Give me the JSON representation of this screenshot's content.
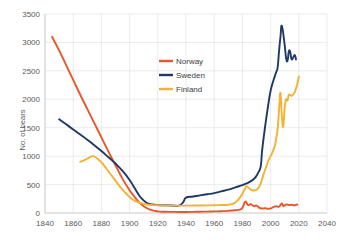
{
  "chart_data": {
    "type": "line",
    "title": "",
    "xlabel": "",
    "ylabel": "No. of bears",
    "xlim": [
      1840,
      2040
    ],
    "ylim": [
      0,
      3500
    ],
    "xticks": [
      1840,
      1860,
      1880,
      1900,
      1920,
      1940,
      1960,
      1980,
      2000,
      2020,
      2040
    ],
    "yticks": [
      0,
      500,
      1000,
      1500,
      2000,
      2500,
      3000,
      3500
    ],
    "xtick_labels": [
      "1840",
      "1860",
      "1880",
      "1900",
      "1920",
      "1940",
      "1960",
      "1980",
      "2000",
      "2020",
      "2040"
    ],
    "ytick_labels": [
      "0",
      "500",
      "1000",
      "1500",
      "2000",
      "2500",
      "3000",
      "3500"
    ],
    "grid": true,
    "legend_position": "center-upper",
    "series": [
      {
        "name": "Norway",
        "color": "#E8562A",
        "points": [
          [
            1845,
            3100
          ],
          [
            1850,
            2860
          ],
          [
            1855,
            2600
          ],
          [
            1860,
            2340
          ],
          [
            1865,
            2080
          ],
          [
            1870,
            1830
          ],
          [
            1875,
            1580
          ],
          [
            1880,
            1330
          ],
          [
            1885,
            1080
          ],
          [
            1890,
            840
          ],
          [
            1895,
            600
          ],
          [
            1900,
            400
          ],
          [
            1903,
            300
          ],
          [
            1906,
            210
          ],
          [
            1910,
            120
          ],
          [
            1915,
            55
          ],
          [
            1920,
            28
          ],
          [
            1925,
            22
          ],
          [
            1930,
            20
          ],
          [
            1935,
            18
          ],
          [
            1940,
            18
          ],
          [
            1945,
            20
          ],
          [
            1950,
            22
          ],
          [
            1955,
            25
          ],
          [
            1960,
            28
          ],
          [
            1965,
            32
          ],
          [
            1970,
            38
          ],
          [
            1975,
            48
          ],
          [
            1978,
            60
          ],
          [
            1980,
            90
          ],
          [
            1982,
            200
          ],
          [
            1984,
            140
          ],
          [
            1986,
            155
          ],
          [
            1988,
            120
          ],
          [
            1990,
            130
          ],
          [
            1992,
            90
          ],
          [
            1994,
            80
          ],
          [
            1996,
            85
          ],
          [
            1998,
            75
          ],
          [
            2000,
            80
          ],
          [
            2002,
            105
          ],
          [
            2004,
            120
          ],
          [
            2006,
            110
          ],
          [
            2008,
            170
          ],
          [
            2009,
            120
          ],
          [
            2011,
            150
          ],
          [
            2013,
            140
          ],
          [
            2015,
            145
          ],
          [
            2017,
            135
          ],
          [
            2019,
            150
          ]
        ]
      },
      {
        "name": "Sweden",
        "color": "#1F3864",
        "points": [
          [
            1850,
            1650
          ],
          [
            1855,
            1560
          ],
          [
            1860,
            1470
          ],
          [
            1865,
            1380
          ],
          [
            1870,
            1290
          ],
          [
            1875,
            1190
          ],
          [
            1880,
            1090
          ],
          [
            1885,
            980
          ],
          [
            1890,
            870
          ],
          [
            1895,
            740
          ],
          [
            1900,
            580
          ],
          [
            1905,
            380
          ],
          [
            1908,
            270
          ],
          [
            1912,
            180
          ],
          [
            1916,
            150
          ],
          [
            1920,
            140
          ],
          [
            1925,
            135
          ],
          [
            1930,
            132
          ],
          [
            1935,
            130
          ],
          [
            1938,
            190
          ],
          [
            1940,
            270
          ],
          [
            1945,
            290
          ],
          [
            1950,
            310
          ],
          [
            1955,
            330
          ],
          [
            1960,
            350
          ],
          [
            1965,
            380
          ],
          [
            1970,
            410
          ],
          [
            1975,
            450
          ],
          [
            1980,
            490
          ],
          [
            1983,
            520
          ],
          [
            1986,
            560
          ],
          [
            1989,
            620
          ],
          [
            1991,
            700
          ],
          [
            1993,
            820
          ],
          [
            1994,
            1100
          ],
          [
            1996,
            1500
          ],
          [
            1998,
            1850
          ],
          [
            2000,
            2150
          ],
          [
            2002,
            2330
          ],
          [
            2004,
            2480
          ],
          [
            2005,
            2560
          ],
          [
            2006,
            2850
          ],
          [
            2007,
            3100
          ],
          [
            2008,
            3290
          ],
          [
            2010,
            2950
          ],
          [
            2011,
            2720
          ],
          [
            2012,
            2680
          ],
          [
            2013,
            2850
          ],
          [
            2014,
            2820
          ],
          [
            2015,
            2700
          ],
          [
            2017,
            2780
          ],
          [
            2018,
            2700
          ]
        ]
      },
      {
        "name": "Finland",
        "color": "#F2B234",
        "points": [
          [
            1865,
            900
          ],
          [
            1868,
            930
          ],
          [
            1871,
            970
          ],
          [
            1874,
            1000
          ],
          [
            1877,
            960
          ],
          [
            1880,
            890
          ],
          [
            1883,
            800
          ],
          [
            1886,
            700
          ],
          [
            1889,
            600
          ],
          [
            1892,
            500
          ],
          [
            1895,
            410
          ],
          [
            1898,
            330
          ],
          [
            1901,
            260
          ],
          [
            1904,
            210
          ],
          [
            1908,
            175
          ],
          [
            1912,
            150
          ],
          [
            1916,
            140
          ],
          [
            1920,
            135
          ],
          [
            1930,
            130
          ],
          [
            1940,
            130
          ],
          [
            1950,
            132
          ],
          [
            1960,
            135
          ],
          [
            1965,
            140
          ],
          [
            1970,
            145
          ],
          [
            1974,
            170
          ],
          [
            1977,
            230
          ],
          [
            1980,
            340
          ],
          [
            1982,
            440
          ],
          [
            1983,
            470
          ],
          [
            1985,
            430
          ],
          [
            1987,
            400
          ],
          [
            1989,
            400
          ],
          [
            1991,
            430
          ],
          [
            1993,
            520
          ],
          [
            1995,
            680
          ],
          [
            1997,
            820
          ],
          [
            1999,
            950
          ],
          [
            2001,
            1050
          ],
          [
            2003,
            1180
          ],
          [
            2004,
            1320
          ],
          [
            2005,
            1480
          ],
          [
            2006,
            1820
          ],
          [
            2007,
            2110
          ],
          [
            2008,
            1700
          ],
          [
            2009,
            1520
          ],
          [
            2010,
            1860
          ],
          [
            2011,
            2000
          ],
          [
            2012,
            1980
          ],
          [
            2013,
            2080
          ],
          [
            2015,
            2060
          ],
          [
            2017,
            2120
          ],
          [
            2019,
            2280
          ],
          [
            2020,
            2400
          ]
        ]
      }
    ]
  },
  "axis": {
    "y_title": "No. of bears"
  },
  "legend": {
    "items": [
      {
        "label": "Norway",
        "color": "#E8562A"
      },
      {
        "label": "Sweden",
        "color": "#1F3864"
      },
      {
        "label": "Finland",
        "color": "#F2B234"
      }
    ]
  }
}
